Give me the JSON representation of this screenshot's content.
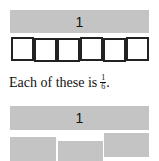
{
  "top_whole": {
    "label": "1"
  },
  "sixths_boxes": {
    "count": 6
  },
  "caption": {
    "text": "Each of these is",
    "fraction_numerator": "1",
    "fraction_denominator": "6",
    "period": "."
  },
  "bottom_whole": {
    "label": "1"
  },
  "pieces": {
    "count": 3
  },
  "colors": {
    "bar_fill": "#c4c4c4",
    "box_border": "#222222",
    "text": "#111111"
  }
}
